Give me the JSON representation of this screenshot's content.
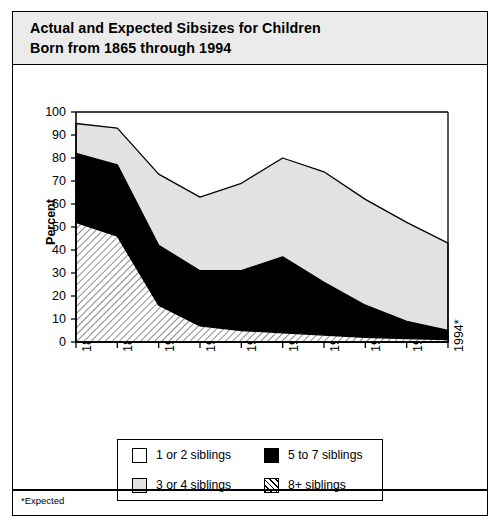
{
  "figure": {
    "title": "Actual and Expected Sibsizes for Children\nBorn from 1865 through 1994",
    "footnote": "*Expected"
  },
  "axes": {
    "y_title": "Percent",
    "x_title": "Year of Child's Birth",
    "y_ticks": [
      "0",
      "10",
      "20",
      "30",
      "40",
      "50",
      "60",
      "70",
      "80",
      "90",
      "100"
    ],
    "x_ticks": [
      "1865",
      "1890",
      "1920s",
      "1930s",
      "1940s",
      "1950s",
      "1960s",
      "1973*",
      "1983*",
      "1994*"
    ]
  },
  "legend": {
    "items": [
      {
        "label": "1 or 2 siblings",
        "swatch": "white",
        "color": "#ffffff"
      },
      {
        "label": "5 to 7 siblings",
        "swatch": "black",
        "color": "#000000"
      },
      {
        "label": "3 or 4 siblings",
        "swatch": "ltgray",
        "color": "#e2e2e2"
      },
      {
        "label": "8+ siblings",
        "swatch": "hatch",
        "color": "#ffffff"
      }
    ]
  },
  "chart_data": {
    "type": "area",
    "title": "Actual and Expected Sibsizes for Children Born from 1865 through 1994",
    "xlabel": "Year of Child's Birth",
    "ylabel": "Percent",
    "ylim": [
      0,
      100
    ],
    "yticks": [
      0,
      10,
      20,
      30,
      40,
      50,
      60,
      70,
      80,
      90,
      100
    ],
    "grid": false,
    "legend_position": "below-plot",
    "stacked": true,
    "note": "Stacked-from-bottom area chart. Values are percent shares per birth cohort; remainder up to 100 is unfilled white area above the topmost band.",
    "categories": [
      "1865",
      "1890",
      "1920s",
      "1930s",
      "1940s",
      "1950s",
      "1960s",
      "1973*",
      "1983*",
      "1994*"
    ],
    "series": [
      {
        "name": "8+ siblings",
        "fill": "hatch",
        "values": [
          52,
          46,
          16,
          7,
          5,
          4,
          3,
          2,
          1.5,
          1
        ]
      },
      {
        "name": "5 to 7 siblings",
        "fill": "black",
        "values": [
          30,
          31,
          26,
          24,
          26,
          33,
          23,
          14,
          7.5,
          4
        ]
      },
      {
        "name": "3 or 4 siblings",
        "fill": "ltgray",
        "values": [
          13,
          16,
          31,
          32,
          38,
          43,
          48,
          46,
          43,
          38
        ]
      },
      {
        "name": "1 or 2 siblings",
        "fill": "white",
        "values": [
          5,
          7,
          27,
          37,
          31,
          20,
          26,
          38,
          48,
          57
        ]
      }
    ],
    "cumulative_tops": {
      "8+ siblings": [
        52,
        46,
        16,
        7,
        5,
        4,
        3,
        2,
        1.5,
        1
      ],
      "5 to 7 siblings": [
        82,
        77,
        42,
        31,
        31,
        37,
        26,
        16,
        9,
        5
      ],
      "3 or 4 siblings": [
        95,
        93,
        73,
        63,
        69,
        80,
        74,
        62,
        52,
        43
      ]
    }
  }
}
